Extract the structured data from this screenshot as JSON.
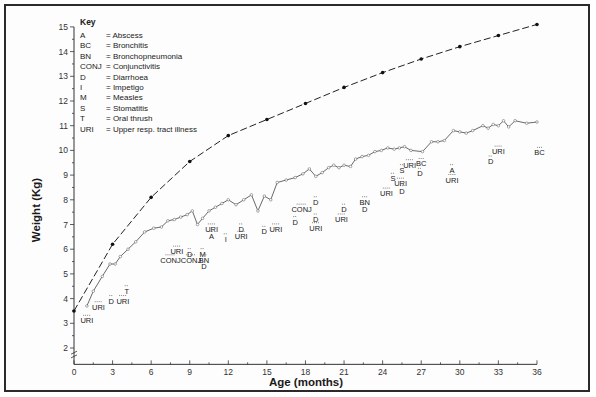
{
  "chart_data": {
    "type": "line",
    "title": "",
    "xlabel": "Age (months)",
    "ylabel": "Weight (Kg)",
    "xlim": [
      0,
      36
    ],
    "ylim": [
      1.5,
      15
    ],
    "x_ticks": [
      0,
      3,
      6,
      9,
      12,
      15,
      18,
      21,
      24,
      27,
      30,
      33,
      36
    ],
    "y_ticks": [
      2,
      3,
      4,
      5,
      6,
      7,
      8,
      9,
      10,
      11,
      12,
      13,
      14,
      15
    ],
    "y_axis_break": true,
    "grid": false,
    "series": [
      {
        "name": "Reference weight (dashed)",
        "style": "dashed",
        "marker": "filled-dot",
        "points": [
          [
            0,
            3.5
          ],
          [
            3,
            6.2
          ],
          [
            6,
            8.1
          ],
          [
            9,
            9.55
          ],
          [
            12,
            10.6
          ],
          [
            15,
            11.25
          ],
          [
            18,
            11.9
          ],
          [
            21,
            12.55
          ],
          [
            24,
            13.15
          ],
          [
            27,
            13.7
          ],
          [
            30,
            14.2
          ],
          [
            33,
            14.65
          ],
          [
            36,
            15.1
          ]
        ]
      },
      {
        "name": "Child weight (solid)",
        "style": "solid",
        "marker": "open-circle",
        "points": [
          [
            1.0,
            3.7
          ],
          [
            1.5,
            4.3
          ],
          [
            2.2,
            4.9
          ],
          [
            2.8,
            5.4
          ],
          [
            3.2,
            5.4
          ],
          [
            3.6,
            5.7
          ],
          [
            4.2,
            6.0
          ],
          [
            4.8,
            6.3
          ],
          [
            5.5,
            6.7
          ],
          [
            6.2,
            6.85
          ],
          [
            6.8,
            6.9
          ],
          [
            7.3,
            7.15
          ],
          [
            7.8,
            7.2
          ],
          [
            8.3,
            7.3
          ],
          [
            8.8,
            7.4
          ],
          [
            9.2,
            7.55
          ],
          [
            9.6,
            7.0
          ],
          [
            10.0,
            7.25
          ],
          [
            10.5,
            7.55
          ],
          [
            11.0,
            7.7
          ],
          [
            11.5,
            7.85
          ],
          [
            12.0,
            8.0
          ],
          [
            12.6,
            7.8
          ],
          [
            13.2,
            8.0
          ],
          [
            13.8,
            8.2
          ],
          [
            14.3,
            7.55
          ],
          [
            14.8,
            8.15
          ],
          [
            15.3,
            8.0
          ],
          [
            15.8,
            8.7
          ],
          [
            16.5,
            8.8
          ],
          [
            17.2,
            8.9
          ],
          [
            17.8,
            9.05
          ],
          [
            18.3,
            9.25
          ],
          [
            18.8,
            8.95
          ],
          [
            19.3,
            9.1
          ],
          [
            19.8,
            9.3
          ],
          [
            20.2,
            9.4
          ],
          [
            20.6,
            9.3
          ],
          [
            21.0,
            9.4
          ],
          [
            21.5,
            9.35
          ],
          [
            21.9,
            9.65
          ],
          [
            22.4,
            9.75
          ],
          [
            22.9,
            9.8
          ],
          [
            23.4,
            9.95
          ],
          [
            23.9,
            10.0
          ],
          [
            24.4,
            10.1
          ],
          [
            24.9,
            10.05
          ],
          [
            25.3,
            10.1
          ],
          [
            25.7,
            10.15
          ],
          [
            26.2,
            10.0
          ],
          [
            27.1,
            9.95
          ],
          [
            27.8,
            10.35
          ],
          [
            28.3,
            10.35
          ],
          [
            28.8,
            10.4
          ],
          [
            29.5,
            10.8
          ],
          [
            30.0,
            10.75
          ],
          [
            30.5,
            10.7
          ],
          [
            31.0,
            10.8
          ],
          [
            31.8,
            11.0
          ],
          [
            32.2,
            10.9
          ],
          [
            32.6,
            11.05
          ],
          [
            33.0,
            11.0
          ],
          [
            33.4,
            11.2
          ],
          [
            33.8,
            10.95
          ],
          [
            34.3,
            11.2
          ],
          [
            35.2,
            11.1
          ],
          [
            36.0,
            11.15
          ]
        ]
      }
    ],
    "legend": {
      "title": "Key",
      "position": "top-left",
      "entries": [
        {
          "code": "A",
          "meaning": "= Abscess"
        },
        {
          "code": "BC",
          "meaning": "= Bronchitis"
        },
        {
          "code": "BN",
          "meaning": "= Bronchopneumonia"
        },
        {
          "code": "CONJ",
          "meaning": "= Conjunctivitis"
        },
        {
          "code": "D",
          "meaning": "= Diarrhoea"
        },
        {
          "code": "I",
          "meaning": "= Impetigo"
        },
        {
          "code": "M",
          "meaning": "= Measles"
        },
        {
          "code": "S",
          "meaning": "= Stomatitis"
        },
        {
          "code": "T",
          "meaning": "= Oral thrush"
        },
        {
          "code": "URI",
          "meaning": "= Upper resp. tract illness"
        }
      ]
    },
    "annotations": [
      {
        "text": "URI",
        "month": 1.0,
        "kg": 3.0
      },
      {
        "text": "URI",
        "month": 1.9,
        "kg": 3.55
      },
      {
        "text": "D",
        "month": 2.9,
        "kg": 3.8
      },
      {
        "text": "URI",
        "month": 3.8,
        "kg": 3.8
      },
      {
        "text": "T",
        "month": 4.1,
        "kg": 4.2
      },
      {
        "text": "URI",
        "month": 8.0,
        "kg": 5.8
      },
      {
        "text": "CONJ",
        "month": 7.5,
        "kg": 5.45
      },
      {
        "text": "D",
        "month": 9.0,
        "kg": 5.7
      },
      {
        "text": "CONJ",
        "month": 9.1,
        "kg": 5.45
      },
      {
        "text": "M",
        "month": 10.0,
        "kg": 5.7
      },
      {
        "text": "BN",
        "month": 10.1,
        "kg": 5.45
      },
      {
        "text": "D",
        "month": 10.1,
        "kg": 5.2
      },
      {
        "text": "URI",
        "month": 10.7,
        "kg": 6.7
      },
      {
        "text": "A",
        "month": 10.7,
        "kg": 6.4
      },
      {
        "text": "I",
        "month": 11.8,
        "kg": 6.3
      },
      {
        "text": "D",
        "month": 13.0,
        "kg": 6.7
      },
      {
        "text": "URI",
        "month": 13.0,
        "kg": 6.4
      },
      {
        "text": "D",
        "month": 14.8,
        "kg": 6.6
      },
      {
        "text": "URI",
        "month": 15.7,
        "kg": 6.7
      },
      {
        "text": "CONJ",
        "month": 17.7,
        "kg": 7.5
      },
      {
        "text": "D",
        "month": 18.8,
        "kg": 7.8
      },
      {
        "text": "D",
        "month": 17.2,
        "kg": 7.0
      },
      {
        "text": "D",
        "month": 18.8,
        "kg": 7.1
      },
      {
        "text": "URI",
        "month": 18.8,
        "kg": 6.75
      },
      {
        "text": "D",
        "month": 21.0,
        "kg": 7.5
      },
      {
        "text": "URI",
        "month": 20.8,
        "kg": 7.1
      },
      {
        "text": "BN",
        "month": 22.6,
        "kg": 7.8
      },
      {
        "text": "D",
        "month": 22.6,
        "kg": 7.5
      },
      {
        "text": "URI",
        "month": 24.3,
        "kg": 8.15
      },
      {
        "text": "S",
        "month": 24.8,
        "kg": 8.75
      },
      {
        "text": "URI",
        "month": 25.4,
        "kg": 8.55
      },
      {
        "text": "D",
        "month": 25.5,
        "kg": 8.25
      },
      {
        "text": "S",
        "month": 25.5,
        "kg": 9.1
      },
      {
        "text": "URI",
        "month": 26.1,
        "kg": 9.3
      },
      {
        "text": "BC",
        "month": 27.0,
        "kg": 9.35
      },
      {
        "text": "D",
        "month": 26.9,
        "kg": 8.95
      },
      {
        "text": "A",
        "month": 29.4,
        "kg": 9.1
      },
      {
        "text": "URI",
        "month": 29.4,
        "kg": 8.7
      },
      {
        "text": "URI",
        "month": 33.0,
        "kg": 9.85
      },
      {
        "text": "D",
        "month": 32.4,
        "kg": 9.45
      },
      {
        "text": "BC",
        "month": 36.2,
        "kg": 9.8
      }
    ]
  },
  "layout": {
    "x0_px": 74,
    "px_per_month": 12.86,
    "y2_px": 348,
    "px_per_kg": 24.7,
    "axis_color": "#333333",
    "line_color": "#444444"
  }
}
